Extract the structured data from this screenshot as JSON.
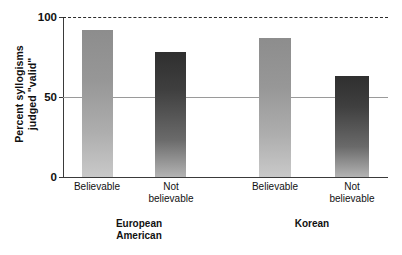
{
  "chart_data": {
    "type": "bar",
    "title": "",
    "xlabel": "",
    "ylabel_line1": "Percent syllogisms",
    "ylabel_line2": "judged \"valid\"",
    "ylim": [
      0,
      100
    ],
    "yticks": [
      0,
      50,
      100
    ],
    "ytick_labels": [
      "0",
      "50",
      "100"
    ],
    "grid": "horizontal line at 50; dashed reference line at 100",
    "legend": "none",
    "categories": [
      "Believable",
      "Not believable",
      "Believable",
      "Not believable"
    ],
    "groups": [
      {
        "name_line1": "European",
        "name_line2": "American"
      },
      {
        "name_line1": "Korean",
        "name_line2": ""
      }
    ],
    "series": [
      {
        "name": "Percent judged valid",
        "values": [
          92,
          78,
          87,
          63
        ]
      }
    ],
    "bars": [
      {
        "label_line1": "Believable",
        "label_line2": "",
        "value": 92,
        "shade": "light",
        "group": "European American"
      },
      {
        "label_line1": "Not",
        "label_line2": "believable",
        "value": 78,
        "shade": "dark",
        "group": "European American"
      },
      {
        "label_line1": "Believable",
        "label_line2": "",
        "value": 87,
        "shade": "light",
        "group": "Korean"
      },
      {
        "label_line1": "Not",
        "label_line2": "believable",
        "value": 63,
        "shade": "dark",
        "group": "Korean"
      }
    ],
    "colors": {
      "bar_light_top": "#8d8d8d",
      "bar_light_bottom": "#c9c9c9",
      "bar_dark_top": "#2f2f2f",
      "bar_dark_bottom": "#b3b3b3",
      "axis": "#3a3a3a",
      "gridline_50": "#9a9a9a",
      "reference_line_100": "#2b2b2b",
      "background": "#ffffff"
    }
  }
}
